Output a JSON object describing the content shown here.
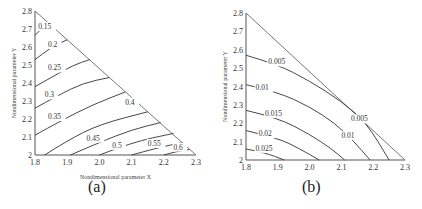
{
  "chart_data": [
    {
      "type": "contour",
      "panel": "(a)",
      "xlabel": "Nondimensional parameter X",
      "ylabel": "Nondimensional parameter Y",
      "xlim": [
        1.8,
        2.3
      ],
      "ylim": [
        2.0,
        2.8
      ],
      "xticks": [
        "1.8",
        "1.9",
        "2.0",
        "2.1",
        "2.2",
        "2.3"
      ],
      "yticks": [
        "2",
        "2.1",
        "2.2",
        "2.3",
        "2.4",
        "2.5",
        "2.6",
        "2.7",
        "2.8"
      ],
      "domain": "triangle (1.8,2.0)-(2.3,2.0)-(1.8,2.8)",
      "grid": false,
      "contours": [
        {
          "level": "0.15",
          "points": [
            [
              1.8,
              2.665
            ],
            [
              1.84,
              2.736
            ]
          ],
          "label_at": [
            1.81,
            2.7
          ]
        },
        {
          "level": "0.2",
          "points": [
            [
              1.8,
              2.53
            ],
            [
              1.85,
              2.6
            ],
            [
              1.9,
              2.64
            ]
          ],
          "label_at": [
            1.84,
            2.6
          ]
        },
        {
          "level": "0.25",
          "points": [
            [
              1.8,
              2.38
            ],
            [
              1.86,
              2.44
            ],
            [
              1.92,
              2.5
            ],
            [
              1.97,
              2.53
            ]
          ],
          "label_at": [
            1.84,
            2.47
          ]
        },
        {
          "level": "0.3",
          "points": [
            [
              1.8,
              2.26
            ],
            [
              1.87,
              2.33
            ],
            [
              1.95,
              2.4
            ],
            [
              2.03,
              2.43
            ]
          ],
          "label_at": [
            1.83,
            2.32
          ]
        },
        {
          "level": "0.35",
          "points": [
            [
              1.8,
              2.11
            ],
            [
              1.88,
              2.19
            ],
            [
              1.98,
              2.28
            ],
            [
              2.08,
              2.35
            ]
          ],
          "label_at": [
            1.84,
            2.2
          ]
        },
        {
          "level": "0.4",
          "points": [
            [
              1.83,
              2.0
            ],
            [
              1.9,
              2.08
            ],
            [
              2.0,
              2.17
            ],
            [
              2.15,
              2.24
            ]
          ],
          "label_at": [
            2.08,
            2.28
          ]
        },
        {
          "level": "0.45",
          "points": [
            [
              1.91,
              2.0
            ],
            [
              2.0,
              2.07
            ],
            [
              2.1,
              2.14
            ],
            [
              2.19,
              2.18
            ]
          ],
          "label_at": [
            1.96,
            2.08
          ]
        },
        {
          "level": "0.5",
          "points": [
            [
              2.0,
              2.0
            ],
            [
              2.1,
              2.07
            ],
            [
              2.23,
              2.12
            ]
          ],
          "label_at": [
            2.04,
            2.04
          ]
        },
        {
          "level": "0.55",
          "points": [
            [
              2.1,
              2.0
            ],
            [
              2.18,
              2.04
            ],
            [
              2.26,
              2.07
            ]
          ],
          "label_at": [
            2.15,
            2.05
          ]
        },
        {
          "level": "0.6",
          "points": [
            [
              2.2,
              2.0
            ],
            [
              2.24,
              2.02
            ],
            [
              2.28,
              2.03
            ]
          ],
          "label_at": [
            2.23,
            2.03
          ]
        }
      ]
    },
    {
      "type": "contour",
      "panel": "(b)",
      "xlabel": "Nondimensional parameter X",
      "ylabel": "Nondimensional parameter Y",
      "xlim": [
        1.8,
        2.3
      ],
      "ylim": [
        2.0,
        2.8
      ],
      "xticks": [
        "1.8",
        "1.9",
        "2.0",
        "2.1",
        "2.2",
        "2.3"
      ],
      "yticks": [
        "2",
        "2.1",
        "2.2",
        "2.3",
        "2.4",
        "2.5",
        "2.6",
        "2.7",
        "2.8"
      ],
      "domain": "triangle (1.8,2.0)-(2.3,2.0)-(1.8,2.8)",
      "grid": false,
      "contours": [
        {
          "level": "0.005",
          "points": [
            [
              1.8,
              2.57
            ],
            [
              1.9,
              2.52
            ],
            [
              2.0,
              2.43
            ],
            [
              2.1,
              2.32
            ],
            [
              2.18,
              2.2
            ],
            [
              2.25,
              2.0
            ]
          ],
          "label_at": [
            1.87,
            2.52
          ],
          "second_label_at": [
            2.13,
            2.21
          ]
        },
        {
          "level": "0.01",
          "points": [
            [
              1.8,
              2.41
            ],
            [
              1.9,
              2.37
            ],
            [
              2.0,
              2.29
            ],
            [
              2.08,
              2.2
            ],
            [
              2.14,
              2.1
            ],
            [
              2.19,
              2.0
            ]
          ],
          "label_at": [
            1.83,
            2.38
          ],
          "second_label_at": [
            2.1,
            2.12
          ]
        },
        {
          "level": "0.015",
          "points": [
            [
              1.8,
              2.27
            ],
            [
              1.9,
              2.23
            ],
            [
              2.0,
              2.14
            ],
            [
              2.07,
              2.06
            ],
            [
              2.11,
              2.0
            ]
          ],
          "label_at": [
            1.86,
            2.24
          ]
        },
        {
          "level": "0.02",
          "points": [
            [
              1.8,
              2.16
            ],
            [
              1.9,
              2.12
            ],
            [
              1.97,
              2.06
            ],
            [
              2.03,
              2.0
            ]
          ],
          "label_at": [
            1.84,
            2.13
          ]
        },
        {
          "level": "0.025",
          "points": [
            [
              1.8,
              2.06
            ],
            [
              1.86,
              2.04
            ],
            [
              1.92,
              2.0
            ]
          ],
          "label_at": [
            1.83,
            2.05
          ]
        }
      ]
    }
  ],
  "captions": {
    "a": "(a)",
    "b": "(b)"
  }
}
